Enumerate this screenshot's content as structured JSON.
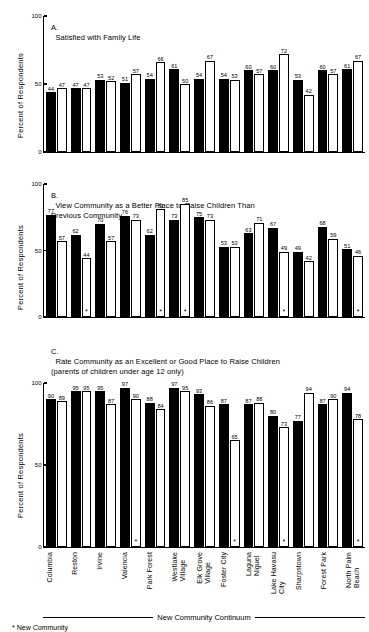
{
  "chart_data": {
    "type": "bar",
    "ylabel": "Percent of Respondents",
    "ylim": [
      0,
      100
    ],
    "yticks": [
      0,
      50,
      100
    ],
    "grid": false,
    "legend_position": "none",
    "xlabel": "New Community Continuum",
    "categories": [
      "Columbia",
      "Reston",
      "Irvine",
      "Valencia",
      "Park Forest",
      "Westlake\nVillage",
      "Elk Grove\nVillage",
      "Foster City",
      "Laguna\nNiguel",
      "Lake Havasu\nCity",
      "Sharpstown",
      "Forest Park",
      "North Palm\nBeach"
    ],
    "series_names": [
      "New Community",
      "Conventional Community"
    ],
    "panels": [
      {
        "id": "A",
        "letter": "A.",
        "title": "Satisfied with Family Life",
        "ylabel": "Percent of Respondents",
        "ylim": [
          0,
          100
        ],
        "yticks": [
          0,
          50,
          100
        ],
        "series": [
          {
            "name": "New Community",
            "values": [
              44,
              47,
              53,
              51,
              54,
              61,
              54,
              54,
              60,
              60,
              53,
              60,
              61
            ]
          },
          {
            "name": "Conventional Community",
            "values": [
              47,
              47,
              52,
              57,
              66,
              50,
              67,
              53,
              57,
              72,
              42,
              57,
              67
            ]
          }
        ],
        "stars_dark": [],
        "stars_light": []
      },
      {
        "id": "B",
        "letter": "B.",
        "title": "View Community as a Better Place to Raise Children Than\nPrevious Community",
        "ylabel": "Percent of Respondents",
        "ylim": [
          0,
          100
        ],
        "yticks": [
          0,
          50,
          100
        ],
        "series": [
          {
            "name": "New Community",
            "values": [
              77,
              62,
              70,
              76,
              62,
              73,
              75,
              53,
              63,
              67,
              49,
              68,
              51
            ]
          },
          {
            "name": "Conventional Community",
            "values": [
              57,
              44,
              57,
              73,
              81,
              85,
              73,
              53,
              71,
              49,
              42,
              59,
              46
            ]
          }
        ],
        "stars_dark": [],
        "stars_light": [
          1,
          4,
          5,
          9,
          12
        ]
      },
      {
        "id": "C",
        "letter": "C.",
        "title": "Rate Community as an Excellent or Good Place to Raise Children\n(parents of children under age 12 only)",
        "ylabel": "Percent of Respondents",
        "ylim": [
          0,
          100
        ],
        "yticks": [
          0,
          50,
          100
        ],
        "series": [
          {
            "name": "New Community",
            "values": [
              90,
              95,
              95,
              97,
              88,
              97,
              93,
              87,
              87,
              80,
              77,
              87,
              94
            ]
          },
          {
            "name": "Conventional Community",
            "values": [
              89,
              95,
              87,
              90,
              84,
              95,
              86,
              65,
              88,
              73,
              94,
              90,
              78
            ]
          }
        ],
        "stars_dark": [],
        "stars_light": [
          3,
          7,
          9,
          12
        ]
      }
    ]
  },
  "axis": {
    "y_top": "100",
    "y_mid": "50",
    "y_bottom": "0",
    "y_title": "Percent of Respondents",
    "continuum_label": "New Community Continuum"
  },
  "footnote": {
    "marker": "*",
    "text": "New Community"
  }
}
